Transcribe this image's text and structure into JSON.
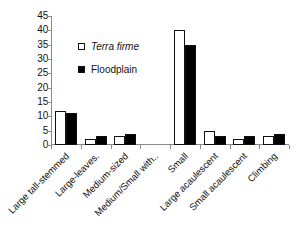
{
  "chart_data": {
    "type": "bar",
    "title": "",
    "subtitle": "",
    "xlabel": "",
    "ylabel": "",
    "ylim": [
      0,
      45
    ],
    "yticks": [
      0,
      5,
      10,
      15,
      20,
      25,
      30,
      35,
      40,
      45
    ],
    "grid": false,
    "legend_position": "inside-upper-left",
    "categories": [
      "Large tall-stemmed",
      "Large-leaves.",
      "Medium-sized",
      "Medium/Small with..",
      "Small",
      "Large acaulescent",
      "Small acaulescent",
      "Climbing"
    ],
    "series": [
      {
        "name": "Terra firme",
        "style": "open",
        "color": "#ffffff",
        "edge_color": "#111111",
        "italic_label": true,
        "values": [
          12,
          2,
          3,
          0,
          40,
          5,
          2,
          3
        ]
      },
      {
        "name": "Floodplain",
        "style": "filled",
        "color": "#000000",
        "edge_color": "#111111",
        "italic_label": false,
        "values": [
          11,
          3,
          4,
          0,
          35,
          3,
          3,
          4
        ]
      }
    ],
    "annotations": []
  },
  "legend": {
    "items": [
      {
        "label": "Terra firme",
        "swatch": "open-square-icon"
      },
      {
        "label": "Floodplain",
        "swatch": "filled-square-icon"
      }
    ]
  },
  "axes": {
    "y_tick_labels": [
      "45",
      "40",
      "35",
      "30",
      "25",
      "20",
      "15",
      "10",
      "5",
      "0"
    ],
    "x_tick_labels": [
      "Large tall-stemmed",
      "Large-leaves.",
      "Medium-sized",
      "Medium/Small with..",
      "Small",
      "Large acaulescent",
      "Small acaulescent",
      "Climbing"
    ]
  }
}
